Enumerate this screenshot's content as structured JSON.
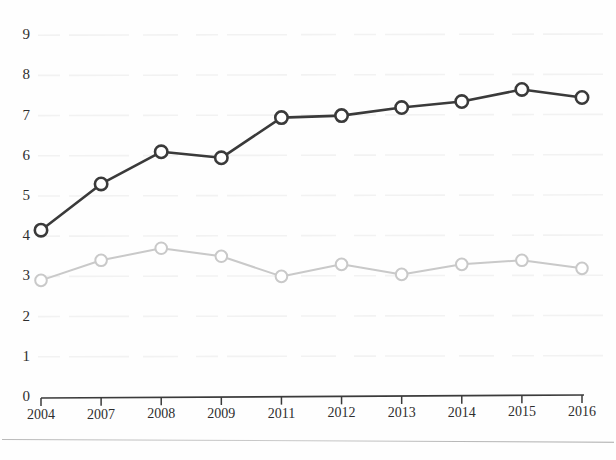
{
  "figure": {
    "title_fragment": "Chart",
    "background_color": "#fefefe",
    "page_rule_color": "#b9b9b9"
  },
  "chart_data": {
    "type": "line",
    "title": "",
    "xlabel": "",
    "ylabel": "",
    "categories": [
      "2004",
      "2007",
      "2008",
      "2009",
      "2011",
      "2012",
      "2013",
      "2014",
      "2015",
      "2016"
    ],
    "yticks": [
      "0",
      "1",
      "2",
      "3",
      "4",
      "5",
      "6",
      "7",
      "8",
      "9"
    ],
    "ylim": [
      0,
      9
    ],
    "grid": "faint-horizontal",
    "legend": "none",
    "series": [
      {
        "name": "dark-series",
        "color": "#3a3a3a",
        "marker": "open-circle",
        "values": [
          4.15,
          5.3,
          6.1,
          5.95,
          6.95,
          7.0,
          7.2,
          7.35,
          7.65,
          7.45
        ]
      },
      {
        "name": "light-series",
        "color": "#c9c9c9",
        "marker": "open-circle",
        "values": [
          2.9,
          3.4,
          3.7,
          3.5,
          3.0,
          3.3,
          3.05,
          3.3,
          3.4,
          3.2
        ]
      }
    ]
  }
}
